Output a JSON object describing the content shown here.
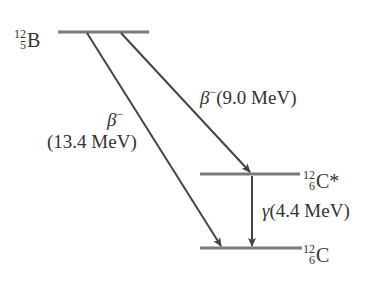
{
  "diagram": {
    "type": "nuclear-energy-level-diagram",
    "levels": [
      {
        "id": "B12",
        "mass_number": "12",
        "atomic_number": "5",
        "symbol": "B",
        "suffix": ""
      },
      {
        "id": "C12-excited",
        "mass_number": "12",
        "atomic_number": "6",
        "symbol": "C",
        "suffix": "*"
      },
      {
        "id": "C12-ground",
        "mass_number": "12",
        "atomic_number": "6",
        "symbol": "C",
        "suffix": ""
      }
    ],
    "transitions": [
      {
        "id": "beta-direct",
        "particle": "β",
        "charge": "−",
        "energy": "(13.4 MeV)",
        "from": "B12",
        "to": "C12-ground"
      },
      {
        "id": "beta-excited",
        "particle": "β",
        "charge": "−",
        "energy": "(9.0 MeV)",
        "from": "B12",
        "to": "C12-excited"
      },
      {
        "id": "gamma",
        "particle": "γ",
        "charge": "",
        "energy": "(4.4 MeV)",
        "from": "C12-excited",
        "to": "C12-ground"
      }
    ],
    "colors": {
      "level_line": "#7a7a7a",
      "arrow": "#444444",
      "text": "#333333",
      "background": "#ffffff"
    }
  }
}
